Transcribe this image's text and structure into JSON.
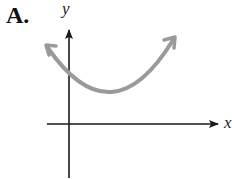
{
  "figure": {
    "choice_label": "A.",
    "y_axis_label": "y",
    "x_axis_label": "x",
    "curve_description": "upward-opening parabola entirely above the x-axis, vertex right of y-axis, arrows on both ends",
    "colors": {
      "axes": "#1a1a1a",
      "curve": "#9a9a9a",
      "background": "#ffffff"
    }
  }
}
